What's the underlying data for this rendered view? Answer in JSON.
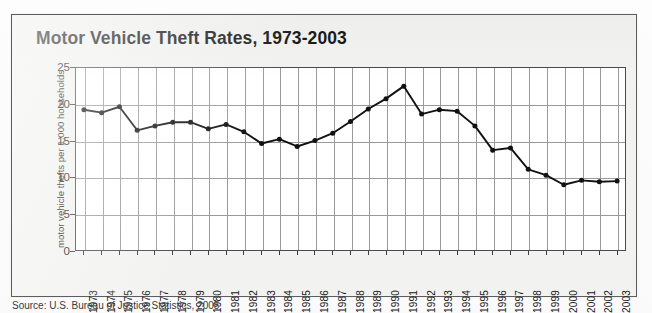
{
  "figure": {
    "title": "Motor Vehicle Theft Rates, 1973-2003",
    "source_note": "Source: U.S. Bureau of Justice Statistics, 2005"
  },
  "chart_data": {
    "type": "line",
    "title": "Motor Vehicle Theft Rates, 1973-2003",
    "xlabel": "",
    "ylabel": "motor vehicle thefts per 1,000 households",
    "ylim": [
      0,
      25
    ],
    "yticks": [
      0,
      5,
      10,
      15,
      20,
      25
    ],
    "ytick_labels": [
      "0",
      "5",
      "10",
      "15",
      "20",
      "25"
    ],
    "grid": true,
    "grid_axes": "both",
    "legend": false,
    "marker": "filled-circle",
    "line_color": "#111111",
    "marker_color": "#111111",
    "categories": [
      "1973",
      "1974",
      "1975",
      "1976",
      "1977",
      "1978",
      "1979",
      "1980",
      "1981",
      "1982",
      "1983",
      "1984",
      "1985",
      "1986",
      "1987",
      "1988",
      "1989",
      "1990",
      "1991",
      "1992",
      "1993",
      "1994",
      "1995",
      "1996",
      "1997",
      "1998",
      "1999",
      "2000",
      "2001",
      "2002",
      "2003"
    ],
    "values": [
      19.2,
      18.8,
      19.6,
      16.4,
      17.0,
      17.5,
      17.5,
      16.6,
      17.2,
      16.2,
      14.6,
      15.2,
      14.2,
      15.0,
      16.0,
      17.6,
      19.3,
      20.7,
      22.4,
      18.6,
      19.2,
      19.0,
      17.0,
      13.7,
      14.0,
      11.1,
      10.3,
      9.0,
      9.6,
      9.4,
      9.5
    ]
  }
}
